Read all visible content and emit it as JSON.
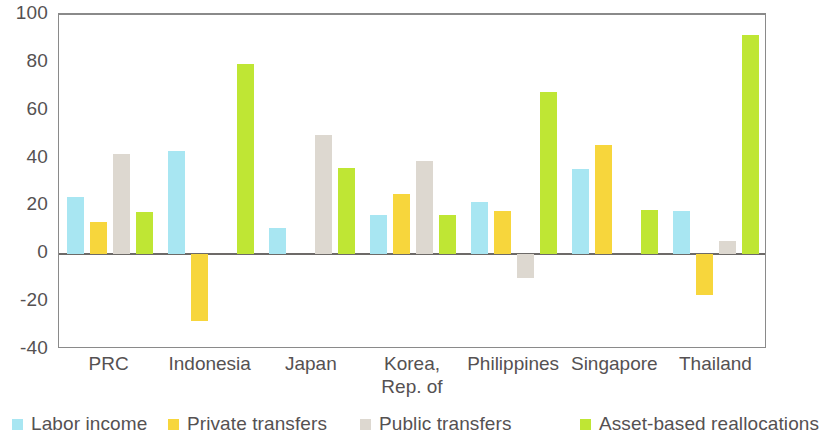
{
  "chart_data": {
    "type": "bar",
    "title": "",
    "subtitle": "",
    "xlabel": "",
    "ylabel": "",
    "ylim": [
      -40,
      100
    ],
    "yticks": [
      -40,
      -20,
      0,
      20,
      40,
      60,
      80,
      100
    ],
    "ytick_labels": [
      "-40",
      "-20",
      "0",
      "20",
      "40",
      "60",
      "80",
      "100"
    ],
    "grid": false,
    "legend_position": "bottom",
    "categories": [
      "PRC",
      "Indonesia",
      "Japan",
      "Korea,\nRep. of",
      "Philippines",
      "Singapore",
      "Thailand"
    ],
    "category_labels": [
      {
        "line1": "PRC",
        "line2": ""
      },
      {
        "line1": "Indonesia",
        "line2": ""
      },
      {
        "line1": "Japan",
        "line2": ""
      },
      {
        "line1": "Korea,",
        "line2": "Rep. of"
      },
      {
        "line1": "Philippines",
        "line2": ""
      },
      {
        "line1": "Singapore",
        "line2": ""
      },
      {
        "line1": "Thailand",
        "line2": ""
      }
    ],
    "series": [
      {
        "name": "Labor income",
        "color": "#a8e6f2",
        "values": [
          24,
          43,
          11,
          16.5,
          22,
          35.5,
          18
        ]
      },
      {
        "name": "Private transfers",
        "color": "#f7d63c",
        "values": [
          13.5,
          -28,
          0,
          25,
          18,
          45.5,
          -17
        ]
      },
      {
        "name": "Public transfers",
        "color": "#ddd8d0",
        "values": [
          42,
          0,
          50,
          39,
          -10,
          0,
          5.5
        ]
      },
      {
        "name": "Asset-based reallocations",
        "color": "#bfe634",
        "values": [
          17.5,
          79.5,
          36,
          16.5,
          68,
          18.5,
          91.5
        ]
      }
    ]
  },
  "axis": {
    "zero_value": 0,
    "frame_color": "#8a8a8a",
    "zero_line_color": "#6d6a68"
  }
}
